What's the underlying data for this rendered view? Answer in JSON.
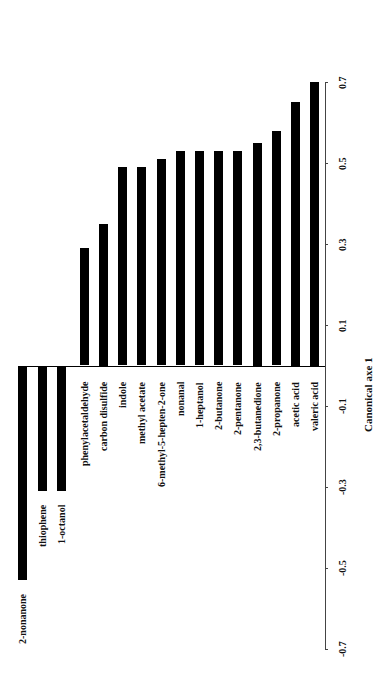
{
  "chart_data": {
    "type": "bar",
    "orientation": "rotated (bars vertical, value axis on right, text rotated -90deg)",
    "title": "",
    "xlabel": "Canonical axe 1",
    "ylabel": "",
    "xlim": [
      -0.7,
      0.7
    ],
    "ticks": [
      0.7,
      0.5,
      0.3,
      0.1,
      -0.1,
      -0.3,
      -0.5,
      -0.7
    ],
    "tick_labels": [
      "0.7",
      "0.5",
      "0.3",
      "0.1",
      "-0.1",
      "-0.3",
      "-0.5",
      "-0.7"
    ],
    "grid": false,
    "legend": null,
    "categories": [
      "2-nonanone",
      "thiophene",
      "1-octanol",
      "phenylacetaldehyde",
      "carbon disulfide",
      "indole",
      "methyl acetate",
      "6-methyl-5-hepten-2-one",
      "nonanal",
      "1-heptanol",
      "2-butanone",
      "2-pentanone",
      "2,3-butanedione",
      "2-propanone",
      "acetic acid",
      "valeric acid"
    ],
    "values": [
      -0.53,
      -0.31,
      -0.31,
      0.29,
      0.35,
      0.49,
      0.49,
      0.51,
      0.53,
      0.53,
      0.53,
      0.53,
      0.55,
      0.58,
      0.65,
      0.7
    ]
  },
  "layout": {
    "axis_x": 325,
    "zero_y": 365.5,
    "px_per_unit": 405,
    "bar_x": [
      18,
      38,
      57,
      80,
      99,
      118,
      137,
      157,
      176,
      195,
      214,
      233,
      253,
      272,
      291,
      310
    ],
    "axis_title_x": 363,
    "axis_title_center_y": 394
  }
}
